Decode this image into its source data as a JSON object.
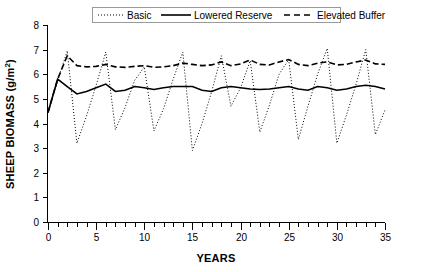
{
  "chart_data": {
    "type": "line",
    "title": "",
    "xlabel": "YEARS",
    "ylabel": "SHEEP BIOMASS (g/m2)",
    "ylabel_display": "SHEEP BIOMASS (g/m²)",
    "xlim": [
      0,
      35
    ],
    "ylim": [
      0,
      8
    ],
    "xticks": [
      0,
      5,
      10,
      15,
      20,
      25,
      30,
      35
    ],
    "xtick_labels": [
      "0",
      "5",
      "10",
      "15",
      "20",
      "25",
      "30",
      "35"
    ],
    "xminor_tick_step": 1,
    "yticks": [
      0,
      1,
      2,
      3,
      4,
      5,
      6,
      7,
      8
    ],
    "ytick_labels": [
      "0",
      "1",
      "2",
      "3",
      "4",
      "5",
      "6",
      "7",
      "8"
    ],
    "grid": false,
    "legend_position": "top-center",
    "line_color": "#000000",
    "x": [
      0,
      1,
      2,
      3,
      4,
      5,
      6,
      7,
      8,
      9,
      10,
      11,
      12,
      13,
      14,
      15,
      16,
      17,
      18,
      19,
      20,
      21,
      22,
      23,
      24,
      25,
      26,
      27,
      28,
      29,
      30,
      31,
      32,
      33,
      34,
      35
    ],
    "series": [
      {
        "name": "Basic",
        "style": "dotted",
        "values": [
          4.45,
          5.75,
          6.95,
          3.2,
          4.3,
          5.55,
          6.9,
          3.75,
          4.65,
          5.75,
          6.3,
          3.7,
          4.6,
          5.8,
          6.9,
          2.9,
          4.0,
          5.3,
          6.75,
          4.7,
          5.45,
          6.55,
          3.65,
          4.75,
          6.0,
          6.6,
          3.35,
          4.7,
          6.0,
          7.05,
          3.2,
          4.35,
          5.6,
          7.0,
          3.55,
          4.55
        ]
      },
      {
        "name": "Lowered Reserve",
        "style": "solid",
        "values": [
          4.45,
          5.8,
          5.5,
          5.2,
          5.3,
          5.45,
          5.6,
          5.3,
          5.35,
          5.5,
          5.45,
          5.38,
          5.45,
          5.5,
          5.5,
          5.5,
          5.35,
          5.3,
          5.45,
          5.5,
          5.45,
          5.4,
          5.38,
          5.4,
          5.45,
          5.5,
          5.4,
          5.35,
          5.5,
          5.45,
          5.35,
          5.4,
          5.5,
          5.55,
          5.5,
          5.4
        ]
      },
      {
        "name": "Elevated Buffer",
        "style": "dashed",
        "values": [
          4.45,
          5.8,
          6.75,
          6.35,
          6.3,
          6.32,
          6.4,
          6.3,
          6.28,
          6.32,
          6.35,
          6.28,
          6.3,
          6.35,
          6.45,
          6.4,
          6.35,
          6.38,
          6.5,
          6.35,
          6.42,
          6.58,
          6.4,
          6.38,
          6.5,
          6.6,
          6.4,
          6.35,
          6.45,
          6.5,
          6.38,
          6.4,
          6.5,
          6.58,
          6.42,
          6.4
        ]
      }
    ]
  },
  "legend": {
    "entries": [
      {
        "label": "Basic",
        "style": "dotted"
      },
      {
        "label": "Lowered Reserve",
        "style": "solid"
      },
      {
        "label": "Elevated Buffer",
        "style": "dashed"
      }
    ]
  }
}
